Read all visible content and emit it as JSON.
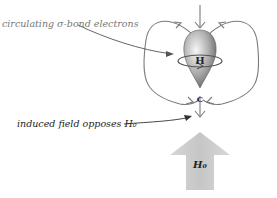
{
  "labels": {
    "sigma_electrons": "circulating σ-bond electrons",
    "induced_field": "induced field opposes H₀",
    "applied_field": "H₀"
  },
  "atoms": {
    "hydrogen": "H",
    "carbon": "C"
  },
  "colors": {
    "field_lines": "#7a7a7a",
    "applied_arrow": "#cdcdcd",
    "orbital_light": "#f2f2f2",
    "orbital_dark": "#6a6a6a",
    "text": "#444444"
  }
}
